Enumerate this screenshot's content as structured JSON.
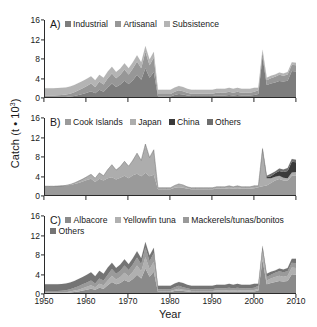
{
  "figure": {
    "y_axis_title_main": "Catch (t",
    "y_axis_title_mid": " • 10",
    "y_axis_title_sup": "3",
    "y_axis_title_end": ")",
    "x_axis_title": "Year"
  },
  "axes": {
    "y_ticks": [
      "0",
      "4",
      "8",
      "12",
      "16"
    ],
    "x_ticks": [
      "1950",
      "1960",
      "1970",
      "1980",
      "1990",
      "2000",
      "2010"
    ]
  },
  "panels": [
    {
      "key": "A",
      "label": "A)",
      "legend_rows": [
        [
          {
            "label": "Industrial",
            "color": "#7d7d7d"
          },
          {
            "label": "Artisanal",
            "color": "#979797"
          },
          {
            "label": "Subsistence",
            "color": "#b4b4b4"
          }
        ]
      ]
    },
    {
      "key": "B",
      "label": "B)",
      "legend_rows": [
        [
          {
            "label": "Cook Islands",
            "color": "#9a9a9a"
          },
          {
            "label": "Japan",
            "color": "#adadad"
          },
          {
            "label": "China",
            "color": "#3a3a3a"
          },
          {
            "label": "Others",
            "color": "#6e6e6e"
          }
        ]
      ]
    },
    {
      "key": "C",
      "label": "C)",
      "legend_rows": [
        [
          {
            "label": "Albacore",
            "color": "#8a8a8a"
          },
          {
            "label": "Yellowfin tuna",
            "color": "#b0b0b0"
          },
          {
            "label": "Mackerels/tunas/bonitos",
            "color": "#9a9a9a"
          }
        ],
        [
          {
            "label": "Others",
            "color": "#747474"
          }
        ]
      ]
    }
  ],
  "chart_data": {
    "type": "area",
    "xlabel": "Year",
    "ylabel": "Catch (t • 10^3)",
    "xlim": [
      1950,
      2010
    ],
    "ylim": [
      0,
      16
    ],
    "stacked": true,
    "grid": false,
    "legend_position": "inside-top-left",
    "x": [
      1950,
      1951,
      1952,
      1953,
      1954,
      1955,
      1956,
      1957,
      1958,
      1959,
      1960,
      1961,
      1962,
      1963,
      1964,
      1965,
      1966,
      1967,
      1968,
      1969,
      1970,
      1971,
      1972,
      1973,
      1974,
      1975,
      1976,
      1977,
      1978,
      1979,
      1980,
      1981,
      1982,
      1983,
      1984,
      1985,
      1986,
      1987,
      1988,
      1989,
      1990,
      1991,
      1992,
      1993,
      1994,
      1995,
      1996,
      1997,
      1998,
      1999,
      2000,
      2001,
      2002,
      2003,
      2004,
      2005,
      2006,
      2007,
      2008,
      2009,
      2010
    ],
    "panels": [
      {
        "key": "A",
        "label": "A)",
        "series": [
          {
            "name": "Industrial",
            "color": "#7d7d7d",
            "values": [
              0,
              0,
              0,
              0,
              0,
              0,
              0.1,
              0.2,
              0.4,
              0.6,
              0.9,
              1.2,
              0.8,
              1.5,
              1.1,
              2.0,
              2.8,
              2.1,
              2.6,
              3.4,
              2.7,
              3.5,
              4.6,
              3.6,
              6.0,
              4.0,
              5.2,
              0.1,
              0.1,
              0.1,
              0.1,
              0.4,
              0.6,
              0.5,
              0.3,
              0.2,
              0.2,
              0.2,
              0.2,
              0.2,
              0.2,
              0.3,
              0.3,
              0.3,
              0.4,
              0.3,
              0.4,
              0.3,
              0.3,
              0.3,
              0.4,
              0.6,
              8.4,
              2.5,
              2.8,
              3.0,
              3.3,
              3.2,
              3.4,
              5.4,
              5.3
            ]
          },
          {
            "name": "Artisanal",
            "color": "#979797",
            "values": [
              0.3,
              0.3,
              0.3,
              0.35,
              0.4,
              0.5,
              0.6,
              0.8,
              1.0,
              1.2,
              1.4,
              1.6,
              1.3,
              1.7,
              1.5,
              1.9,
              2.1,
              1.8,
              2.0,
              2.3,
              2.0,
              2.4,
              2.8,
              2.4,
              3.4,
              2.6,
              3.0,
              0.5,
              0.5,
              0.5,
              0.5,
              0.7,
              0.8,
              0.7,
              0.6,
              0.5,
              0.5,
              0.5,
              0.5,
              0.5,
              0.5,
              0.6,
              0.6,
              0.6,
              0.7,
              0.6,
              0.7,
              0.6,
              0.6,
              0.6,
              0.7,
              0.8,
              0.9,
              1.0,
              1.1,
              1.2,
              1.3,
              1.2,
              1.3,
              1.3,
              1.3
            ]
          },
          {
            "name": "Subsistence",
            "color": "#b4b4b4",
            "values": [
              1.5,
              1.5,
              1.5,
              1.5,
              1.5,
              1.5,
              1.5,
              1.5,
              1.5,
              1.5,
              1.5,
              1.5,
              1.4,
              1.4,
              1.4,
              1.4,
              1.4,
              1.3,
              1.3,
              1.3,
              1.3,
              1.3,
              1.3,
              1.2,
              1.2,
              1.2,
              1.2,
              0.9,
              0.9,
              0.9,
              0.9,
              0.9,
              0.9,
              0.9,
              0.8,
              0.8,
              0.8,
              0.8,
              0.8,
              0.8,
              0.8,
              0.8,
              0.8,
              0.8,
              0.8,
              0.8,
              0.8,
              0.8,
              0.8,
              0.8,
              0.8,
              0.5,
              0.5,
              0.5,
              0.5,
              0.5,
              0.5,
              0.5,
              0.5,
              0.5,
              0.5
            ]
          }
        ]
      },
      {
        "key": "B",
        "label": "B)",
        "series": [
          {
            "name": "Cook Islands",
            "color": "#9a9a9a",
            "values": [
              1.8,
              1.8,
              1.8,
              1.85,
              1.9,
              2.0,
              2.1,
              2.3,
              2.5,
              2.8,
              3.1,
              3.4,
              2.7,
              3.4,
              3.0,
              3.5,
              3.7,
              3.2,
              3.6,
              4.0,
              3.5,
              4.1,
              4.4,
              3.9,
              4.6,
              3.9,
              4.2,
              1.2,
              1.2,
              1.2,
              1.2,
              1.5,
              1.6,
              1.5,
              1.3,
              1.2,
              1.2,
              1.2,
              1.2,
              1.2,
              1.2,
              1.3,
              1.3,
              1.3,
              1.4,
              1.3,
              1.4,
              1.3,
              1.3,
              1.3,
              1.4,
              1.6,
              1.8,
              2.0,
              2.5,
              3.0,
              3.3,
              3.0,
              3.0,
              4.0,
              4.0
            ]
          },
          {
            "name": "Japan",
            "color": "#adadad",
            "values": [
              0,
              0,
              0,
              0,
              0,
              0,
              0.1,
              0.2,
              0.4,
              0.5,
              0.7,
              0.9,
              0.8,
              1.2,
              1.0,
              1.8,
              2.6,
              2.0,
              2.3,
              3.0,
              2.5,
              3.1,
              4.3,
              3.3,
              6.0,
              3.9,
              5.2,
              0.3,
              0.3,
              0.3,
              0.3,
              0.5,
              0.7,
              0.6,
              0.4,
              0.3,
              0.3,
              0.3,
              0.3,
              0.3,
              0.3,
              0.4,
              0.4,
              0.4,
              0.5,
              0.4,
              0.5,
              0.4,
              0.4,
              0.4,
              0.5,
              0.3,
              7.7,
              1.5,
              1.0,
              0.8,
              0.7,
              0.6,
              0.5,
              0.7,
              0.8
            ]
          },
          {
            "name": "China",
            "color": "#3a3a3a",
            "values": [
              0,
              0,
              0,
              0,
              0,
              0,
              0,
              0,
              0,
              0,
              0,
              0,
              0,
              0,
              0,
              0,
              0,
              0,
              0,
              0,
              0,
              0,
              0,
              0,
              0,
              0,
              0,
              0,
              0,
              0,
              0,
              0,
              0,
              0,
              0,
              0,
              0,
              0,
              0,
              0,
              0,
              0,
              0,
              0,
              0,
              0,
              0,
              0,
              0,
              0,
              0,
              0,
              0,
              0.2,
              0.4,
              0.7,
              1.0,
              1.2,
              1.5,
              2.2,
              2.0
            ]
          },
          {
            "name": "Others",
            "color": "#6e6e6e",
            "values": [
              0,
              0,
              0,
              0,
              0,
              0,
              0,
              0,
              0,
              0,
              0,
              0,
              0,
              0,
              0,
              0,
              0,
              0,
              0,
              0,
              0,
              0,
              0,
              0,
              0,
              0,
              0,
              0,
              0,
              0,
              0,
              0,
              0,
              0,
              0,
              0,
              0,
              0,
              0,
              0,
              0,
              0,
              0,
              0,
              0,
              0,
              0,
              0,
              0,
              0,
              0,
              0,
              0.3,
              0.3,
              0.5,
              0.4,
              0.5,
              0.5,
              0.6,
              0.6,
              0.5
            ]
          }
        ]
      },
      {
        "key": "C",
        "label": "C)",
        "series": [
          {
            "name": "Albacore",
            "color": "#8a8a8a",
            "values": [
              0,
              0,
              0,
              0,
              0,
              0,
              0.1,
              0.2,
              0.3,
              0.5,
              0.7,
              0.9,
              0.7,
              1.1,
              0.9,
              1.6,
              2.3,
              1.8,
              2.1,
              2.7,
              2.3,
              2.9,
              3.8,
              3.0,
              5.1,
              3.4,
              4.4,
              0.2,
              0.2,
              0.2,
              0.2,
              0.4,
              0.5,
              0.4,
              0.3,
              0.2,
              0.2,
              0.2,
              0.2,
              0.2,
              0.2,
              0.3,
              0.3,
              0.3,
              0.3,
              0.3,
              0.3,
              0.3,
              0.3,
              0.3,
              0.3,
              0.5,
              6.9,
              1.8,
              2.1,
              2.3,
              2.5,
              2.4,
              2.5,
              3.9,
              3.8
            ]
          },
          {
            "name": "Yellowfin tuna",
            "color": "#b0b0b0",
            "values": [
              0.1,
              0.1,
              0.1,
              0.1,
              0.1,
              0.15,
              0.2,
              0.3,
              0.4,
              0.5,
              0.6,
              0.7,
              0.5,
              0.8,
              0.7,
              1.0,
              1.3,
              1.0,
              1.2,
              1.5,
              1.2,
              1.5,
              1.9,
              1.5,
              2.4,
              1.6,
              2.1,
              0.2,
              0.2,
              0.2,
              0.2,
              0.3,
              0.4,
              0.3,
              0.3,
              0.2,
              0.2,
              0.2,
              0.2,
              0.2,
              0.2,
              0.2,
              0.2,
              0.2,
              0.3,
              0.2,
              0.3,
              0.2,
              0.2,
              0.2,
              0.3,
              0.4,
              1.6,
              0.8,
              0.9,
              1.0,
              1.1,
              1.0,
              1.1,
              1.4,
              1.4
            ]
          },
          {
            "name": "Mackerels/tunas/bonitos",
            "color": "#9a9a9a",
            "values": [
              0.3,
              0.3,
              0.3,
              0.3,
              0.35,
              0.4,
              0.5,
              0.6,
              0.7,
              0.8,
              0.9,
              1.0,
              0.8,
              1.1,
              1.0,
              1.2,
              1.4,
              1.2,
              1.3,
              1.5,
              1.3,
              1.5,
              1.7,
              1.5,
              2.0,
              1.6,
              1.8,
              0.4,
              0.4,
              0.4,
              0.4,
              0.5,
              0.6,
              0.5,
              0.4,
              0.4,
              0.4,
              0.4,
              0.4,
              0.4,
              0.4,
              0.5,
              0.5,
              0.5,
              0.5,
              0.5,
              0.5,
              0.5,
              0.5,
              0.5,
              0.5,
              0.6,
              0.6,
              0.7,
              0.8,
              0.9,
              0.9,
              0.9,
              0.9,
              1.0,
              1.0
            ]
          },
          {
            "name": "Others",
            "color": "#747474",
            "values": [
              1.4,
              1.4,
              1.4,
              1.4,
              1.4,
              1.45,
              1.4,
              1.4,
              1.5,
              1.5,
              1.6,
              1.7,
              1.5,
              1.6,
              1.4,
              1.5,
              1.3,
              1.2,
              1.3,
              1.3,
              1.2,
              1.3,
              1.3,
              1.2,
              1.1,
              1.2,
              1.1,
              0.7,
              0.7,
              0.7,
              0.7,
              0.8,
              0.8,
              0.9,
              0.7,
              0.7,
              0.7,
              0.7,
              0.7,
              0.7,
              0.7,
              0.7,
              0.7,
              0.7,
              0.8,
              0.7,
              0.8,
              0.7,
              0.7,
              0.7,
              0.8,
              0.4,
              0.7,
              0.7,
              0.6,
              0.5,
              0.6,
              0.6,
              0.7,
              0.8,
              0.9
            ]
          }
        ]
      }
    ]
  }
}
